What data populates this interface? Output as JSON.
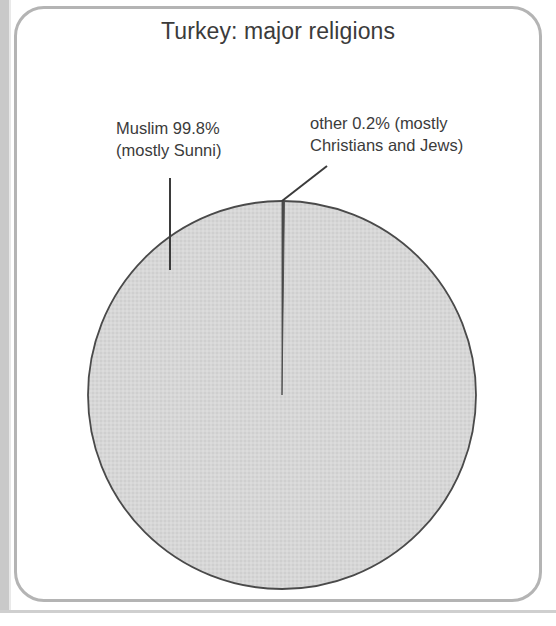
{
  "figure": {
    "title": "Turkey: major religions",
    "frame": {
      "border_color": "#b4b4b4",
      "background_color": "#ffffff",
      "backdrop_color": "#c9c9c9"
    }
  },
  "annotations": {
    "muslim": {
      "line1": "Muslim 99.8%",
      "line2": "(mostly Sunni)"
    },
    "other": {
      "line1": "other 0.2% (mostly",
      "line2": "Christians and Jews)"
    }
  },
  "chart_data": {
    "type": "pie",
    "title": "Turkey: major religions",
    "xlabel": "",
    "ylabel": "",
    "categories": [
      "Muslim (mostly Sunni)",
      "other (mostly Christians and Jews)"
    ],
    "values": [
      99.8,
      0.2
    ],
    "units": "percent",
    "labels": [
      "Muslim 99.8% (mostly Sunni)",
      "other 0.2% (mostly Christians and Jews)"
    ],
    "colors": [
      "#d5d5d5",
      "#4a4a4a"
    ],
    "slice_outline_color": "#4a4a4a",
    "start_angle_deg": 90,
    "direction": "clockwise",
    "legend": "none",
    "grid": false,
    "annotations": [
      {
        "text": "Muslim 99.8% (mostly Sunni)",
        "slice": "Muslim (mostly Sunni)",
        "value": 99.8,
        "leader_line": "vertical"
      },
      {
        "text": "other 0.2% (mostly Christians and Jews)",
        "slice": "other (mostly Christians and Jews)",
        "value": 0.2,
        "leader_line": "diagonal"
      }
    ]
  },
  "geometry": {
    "pie_center_x": 282,
    "pie_center_y": 395,
    "pie_radius": 194
  }
}
